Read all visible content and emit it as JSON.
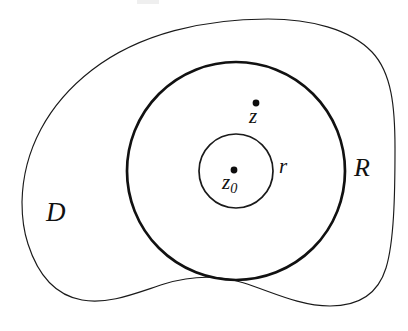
{
  "figure": {
    "kind": "complex-analysis-annulus-diagram",
    "background_color": "#ffffff",
    "ink_color": "#111111",
    "width": 408,
    "height": 331,
    "labels": {
      "domain": "D",
      "outer_radius": "R",
      "inner_radius": "r",
      "point": "z",
      "center_base": "z",
      "center_subscript": "0"
    },
    "geometry": {
      "center": {
        "x": 236,
        "y": 171
      },
      "major_circle_radius": 109,
      "minor_circle_radius": 37,
      "point_z": {
        "x": 256,
        "y": 103
      },
      "point_z0": {
        "x": 234,
        "y": 170
      },
      "point_marker_radius": 3.4,
      "region_path": "M 22 202 C 23 150 48 104 92 70 C 140 33 205 19 268 19 C 310 19 350 29 372 52 C 392 73 395 108 395 148 C 395 196 394 242 386 268 C 378 294 358 306 330 306 C 300 306 272 292 244 283 C 216 274 190 276 164 284 C 136 293 108 305 82 300 C 54 295 37 272 28 244 C 23 229 22 215 22 202 Z"
    }
  }
}
